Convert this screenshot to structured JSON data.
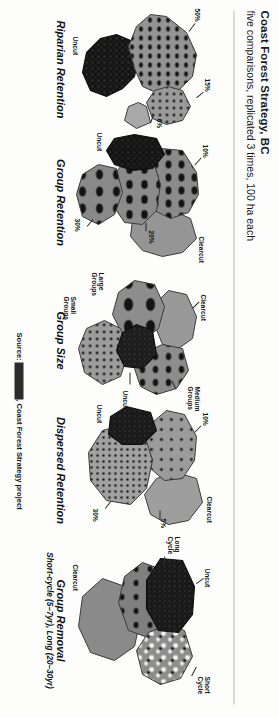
{
  "header": {
    "title": "Coast Forest Strategy, BC",
    "subtitle": "five comparisons, replicated 3 times, 100 ha each"
  },
  "source": {
    "prefix": "Source:",
    "author": "Bill Beese",
    "rest": ", Coast Forest Strategy project",
    "full": "Source: Bill Beese, Coast Forest Strategy project"
  },
  "panels": [
    {
      "id": "riparian-retention",
      "caption": "Riparian Retention",
      "subcaption": "",
      "labels": [
        "50%",
        "15%",
        "6%",
        "Uncut"
      ]
    },
    {
      "id": "group-retention",
      "caption": "Group Retention",
      "subcaption": "",
      "labels": [
        "10%",
        "20%",
        "30%",
        "Uncut",
        "Clearcut"
      ]
    },
    {
      "id": "group-size",
      "caption": "Group Size",
      "subcaption": "",
      "labels": [
        "Large Groups",
        "Medium Groups",
        "Small Groups",
        "Uncut",
        "Clearcut"
      ]
    },
    {
      "id": "dispersed-retention",
      "caption": "Dispersed Retention",
      "subcaption": "",
      "labels": [
        "10%",
        "5%",
        "30%",
        "Uncut",
        "Clearcut"
      ]
    },
    {
      "id": "group-removal",
      "caption": "Group Removal",
      "subcaption": "Short-cycle (5–7yr), Long (20–30yr)",
      "labels": [
        "Uncut",
        "Short Cycle",
        "Long Cycle",
        "Clearcut"
      ]
    }
  ],
  "colors": {
    "uncut": "#171717",
    "mid_grey": "#8e8e8e",
    "light_grey": "#b4b4b4",
    "dark_grey": "#6a6a6a",
    "paper": "#fdfdfc",
    "ink": "#141414"
  },
  "legend_text": {
    "p1_l0": "50%",
    "p1_l1": "15%",
    "p1_l2": "6%",
    "p1_l3": "Uncut",
    "p2_l0": "10%",
    "p2_l1": "20%",
    "p2_l2": "30%",
    "p2_l3": "Uncut",
    "p2_l4": "Clearcut",
    "p3_l0a": "Large",
    "p3_l0b": "Groups",
    "p3_l1a": "Medium",
    "p3_l1b": "Groups",
    "p3_l2a": "Small",
    "p3_l2b": "Groups",
    "p3_l3": "Uncut",
    "p3_l4": "Clearcut",
    "p4_l0": "10%",
    "p4_l1": "5%",
    "p4_l2": "30%",
    "p4_l3": "Uncut",
    "p4_l4": "Clearcut",
    "p5_l0": "Uncut",
    "p5_l1a": "Short",
    "p5_l1b": "Cycle",
    "p5_l2a": "Long",
    "p5_l2b": "Cycle",
    "p5_l3": "Clearcut"
  }
}
